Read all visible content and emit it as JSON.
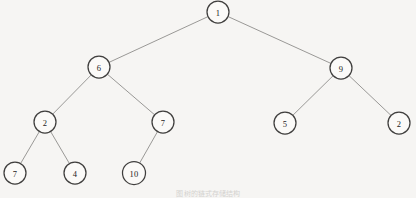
{
  "figure": {
    "kind": "binary-tree-diagram",
    "width": 416,
    "height": 198,
    "background_color": "#f6f5f3",
    "node_fill_color": "#fbfaf8",
    "node_stroke_color": "#403f3e",
    "edge_color": "#8e8d8b",
    "label_color": "#1d1c1b",
    "caption": "图 树的链式存储结构"
  },
  "chart_data": {
    "type": "diagram",
    "title": "",
    "nodes": [
      {
        "id": "n1",
        "label": "1",
        "x": 218,
        "y": 12,
        "r": 11,
        "level": 0
      },
      {
        "id": "n2",
        "label": "6",
        "x": 99,
        "y": 67,
        "r": 11,
        "level": 1
      },
      {
        "id": "n3",
        "label": "9",
        "x": 341,
        "y": 68,
        "r": 11,
        "level": 1
      },
      {
        "id": "n4",
        "label": "2",
        "x": 45,
        "y": 122,
        "r": 11,
        "level": 2
      },
      {
        "id": "n5",
        "label": "7",
        "x": 163,
        "y": 122,
        "r": 11,
        "level": 2
      },
      {
        "id": "n6",
        "label": "5",
        "x": 285,
        "y": 123,
        "r": 11,
        "level": 2
      },
      {
        "id": "n7",
        "label": "2",
        "x": 399,
        "y": 123,
        "r": 11,
        "level": 2
      },
      {
        "id": "n8",
        "label": "7",
        "x": 15,
        "y": 173,
        "r": 11,
        "level": 3
      },
      {
        "id": "n9",
        "label": "4",
        "x": 75,
        "y": 173,
        "r": 11,
        "level": 3
      },
      {
        "id": "n10",
        "label": "10",
        "x": 134,
        "y": 173,
        "r": 11.5,
        "level": 3
      }
    ],
    "edges": [
      {
        "from": "n1",
        "to": "n2"
      },
      {
        "from": "n1",
        "to": "n3"
      },
      {
        "from": "n2",
        "to": "n4"
      },
      {
        "from": "n2",
        "to": "n5"
      },
      {
        "from": "n3",
        "to": "n6"
      },
      {
        "from": "n3",
        "to": "n7"
      },
      {
        "from": "n4",
        "to": "n8"
      },
      {
        "from": "n4",
        "to": "n9"
      },
      {
        "from": "n5",
        "to": "n10"
      }
    ]
  }
}
